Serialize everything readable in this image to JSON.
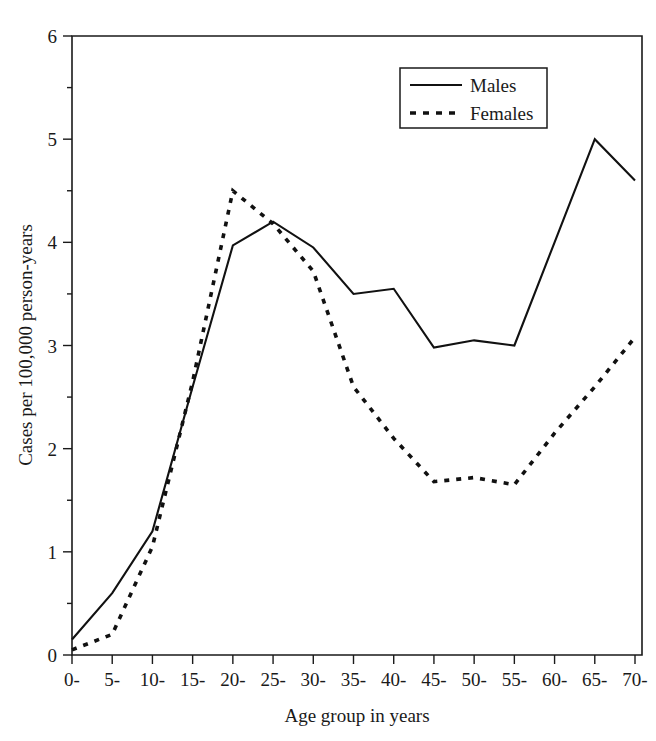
{
  "chart_data": {
    "type": "line",
    "title": "",
    "xlabel": "Age group in years",
    "ylabel": "Cases per 100,000 person-years",
    "categories": [
      "0-",
      "5-",
      "10-",
      "15-",
      "20-",
      "25-",
      "30-",
      "35-",
      "40-",
      "45-",
      "50-",
      "55-",
      "60-",
      "65-",
      "70-"
    ],
    "ylim": [
      0,
      6
    ],
    "yticks": [
      0,
      1,
      2,
      3,
      4,
      5,
      6
    ],
    "ytick_labels": [
      "0",
      "1",
      "2",
      "3",
      "4",
      "5",
      "6"
    ],
    "grid": false,
    "legend_position": "top-right",
    "series": [
      {
        "name": "Males",
        "style": "solid",
        "color": "#111111",
        "values": [
          0.15,
          0.6,
          1.2,
          2.6,
          3.97,
          4.2,
          3.95,
          3.5,
          3.55,
          2.98,
          3.05,
          3.0,
          4.0,
          5.0,
          4.6
        ]
      },
      {
        "name": "Females",
        "style": "dashed",
        "color": "#111111",
        "values": [
          0.05,
          0.2,
          1.05,
          2.65,
          4.5,
          4.18,
          3.72,
          2.6,
          2.1,
          1.68,
          1.72,
          1.65,
          2.15,
          2.6,
          3.08
        ]
      }
    ]
  },
  "legend": {
    "entries": [
      {
        "label": "Males"
      },
      {
        "label": "Females"
      }
    ]
  },
  "axes": {
    "y_title": "Cases per 100,000 person-years",
    "x_title": "Age group in years"
  }
}
